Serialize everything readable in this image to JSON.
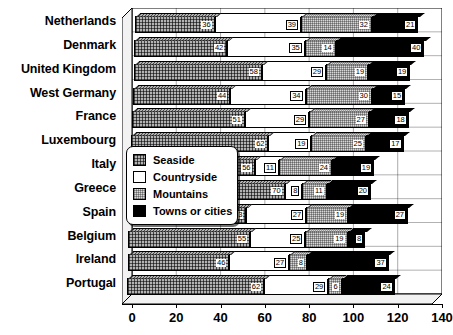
{
  "chart_data": {
    "type": "bar",
    "orientation": "horizontal",
    "stacked": true,
    "title": "",
    "subtitle": "",
    "xlabel": "",
    "ylabel": "",
    "xlim": [
      0,
      140
    ],
    "xticks": [
      0,
      20,
      40,
      60,
      80,
      100,
      120,
      140
    ],
    "grid": true,
    "legend_position": "inside-left-middle",
    "categories": [
      "Netherlands",
      "Denmark",
      "United Kingdom",
      "West Germany",
      "France",
      "Luxembourg",
      "Italy",
      "Greece",
      "Spain",
      "Belgium",
      "Ireland",
      "Portugal"
    ],
    "series": [
      {
        "name": "Seaside",
        "color": "#8a8a8a",
        "pattern": "dense-crosshatch",
        "values": [
          36,
          42,
          58,
          44,
          51,
          62,
          56,
          70,
          53,
          55,
          46,
          62
        ]
      },
      {
        "name": "Countryside",
        "color": "#ffffff",
        "pattern": "solid-white",
        "values": [
          39,
          35,
          29,
          34,
          29,
          19,
          11,
          8,
          27,
          25,
          27,
          29
        ]
      },
      {
        "name": "Mountains",
        "color": "#d8d8d8",
        "pattern": "fine-dot",
        "values": [
          32,
          14,
          19,
          30,
          27,
          25,
          24,
          11,
          19,
          19,
          8,
          6
        ]
      },
      {
        "name": "Towns or cities",
        "color": "#000000",
        "pattern": "solid-black",
        "values": [
          21,
          40,
          19,
          15,
          18,
          17,
          19,
          20,
          27,
          8,
          37,
          24
        ]
      }
    ]
  },
  "legend": {
    "items": [
      {
        "label": "Seaside",
        "swatch": "seaside-swatch"
      },
      {
        "label": "Countryside",
        "swatch": "countryside-swatch"
      },
      {
        "label": "Mountains",
        "swatch": "mountains-swatch"
      },
      {
        "label": "Towns or cities",
        "swatch": "towns-or-cities-swatch"
      }
    ]
  }
}
